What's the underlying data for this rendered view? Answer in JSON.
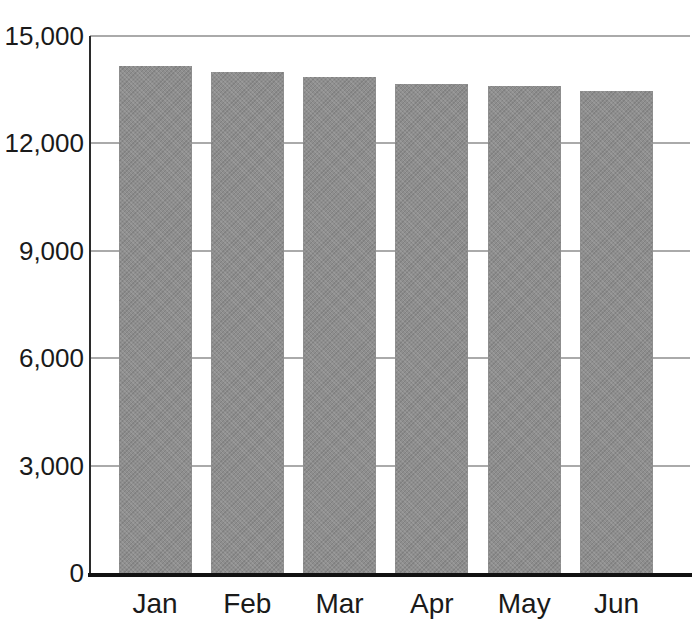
{
  "chart_data": {
    "type": "bar",
    "title": "",
    "xlabel": "",
    "ylabel": "",
    "categories": [
      "Jan",
      "Feb",
      "Mar",
      "Apr",
      "May",
      "Jun"
    ],
    "values": [
      14150,
      14000,
      13850,
      13650,
      13600,
      13450
    ],
    "ylim": [
      0,
      15000
    ],
    "y_ticks": [
      0,
      3000,
      6000,
      9000,
      12000,
      15000
    ],
    "y_tick_labels": [
      "0",
      "3,000",
      "6,000",
      "9,000",
      "12,000",
      "15,000"
    ],
    "grid": "horizontal-gridlines-on",
    "legend": "none"
  },
  "colors": {
    "background": "#ffffff",
    "bar_fill": "#8e8e8e",
    "gridline": "#aaaaaa",
    "axis": "#1a1a1a",
    "text": "#1a1a1a"
  }
}
